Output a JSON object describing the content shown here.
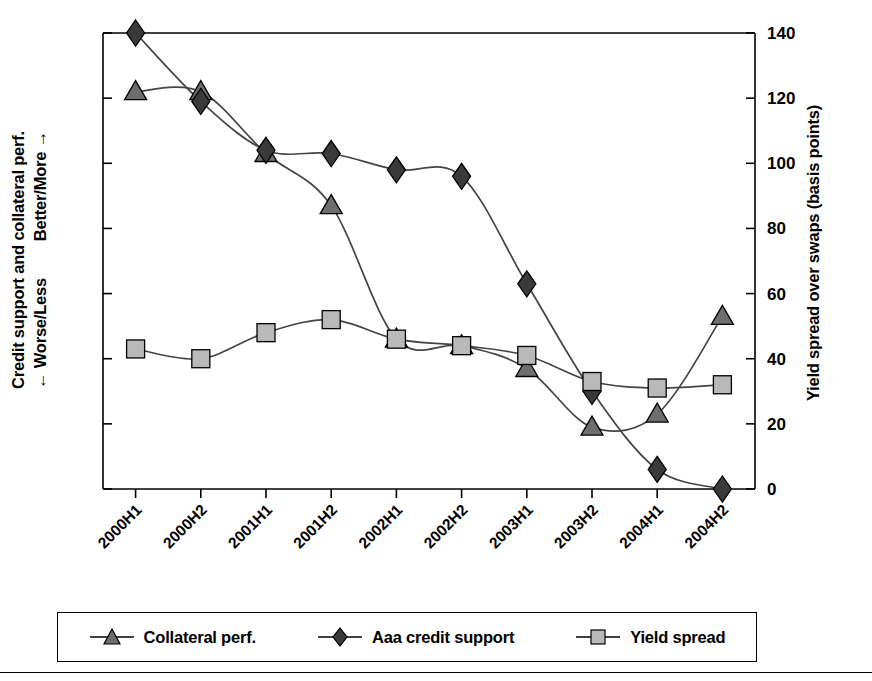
{
  "axes": {
    "left_label_line1": "Credit support and collateral perf.",
    "left_label_worse": "← Worse/Less",
    "left_label_better": "Better/More →",
    "right_label": "Yield spread over swaps (basis points)"
  },
  "legend": {
    "items": [
      {
        "label": "Collateral perf.",
        "marker": "triangle-marker",
        "color": "#6e6e6e"
      },
      {
        "label": "Aaa credit support",
        "marker": "diamond-marker",
        "color": "#3a3a3a"
      },
      {
        "label": "Yield spread",
        "marker": "square-marker",
        "color": "#b9b9b9"
      }
    ]
  },
  "chart_data": {
    "type": "line",
    "title": "",
    "xlabel": "",
    "ylabel": "Credit support and collateral perf.",
    "y2label": "Yield spread over swaps (basis points)",
    "ylim": [
      0,
      140
    ],
    "yticks": [
      0,
      20,
      40,
      60,
      80,
      100,
      120,
      140
    ],
    "ytick_labels": [
      "0",
      "20",
      "40",
      "60",
      "80",
      "100",
      "120",
      "140"
    ],
    "grid": false,
    "legend_position": "bottom",
    "categories": [
      "2000H1",
      "2000H2",
      "2001H1",
      "2001H2",
      "2002H1",
      "2002H2",
      "2003H1",
      "2003H2",
      "2004H1",
      "2004H2"
    ],
    "series": [
      {
        "name": "Collateral perf.",
        "marker": "triangle",
        "color": "#6e6e6e",
        "values": [
          122,
          122,
          103,
          87,
          46,
          44,
          37,
          19,
          23,
          53
        ]
      },
      {
        "name": "Aaa credit support",
        "marker": "diamond",
        "color": "#3a3a3a",
        "values": [
          140,
          119,
          104,
          103,
          98,
          96,
          63,
          30,
          6,
          0
        ]
      },
      {
        "name": "Yield spread",
        "marker": "square",
        "color": "#b9b9b9",
        "values": [
          43,
          40,
          48,
          52,
          46,
          44,
          41,
          33,
          31,
          32
        ]
      }
    ]
  }
}
